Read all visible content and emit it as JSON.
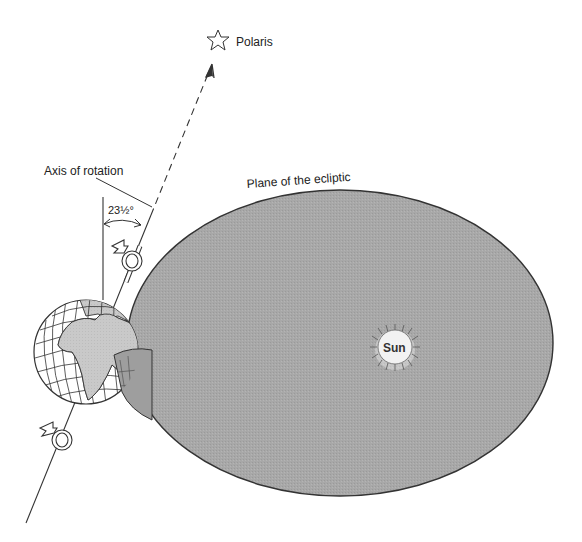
{
  "diagram": {
    "type": "earth-axial-tilt",
    "colors": {
      "background": "#ffffff",
      "ecliptic_fill": "#a9a9a9",
      "line": "#333333",
      "land": "#c8c8c8",
      "ocean": "#ffffff",
      "text": "#222222"
    },
    "labels": {
      "polaris": "Polaris",
      "axis_of_rotation": "Axis of rotation",
      "plane_of_ecliptic": "Plane of the ecliptic",
      "tilt_angle": "23½°",
      "sun": "Sun"
    },
    "icons": {
      "polaris": "star-outline",
      "rotation_arrow": "curved-rotation-arrow",
      "sun": "sun-rays"
    }
  }
}
